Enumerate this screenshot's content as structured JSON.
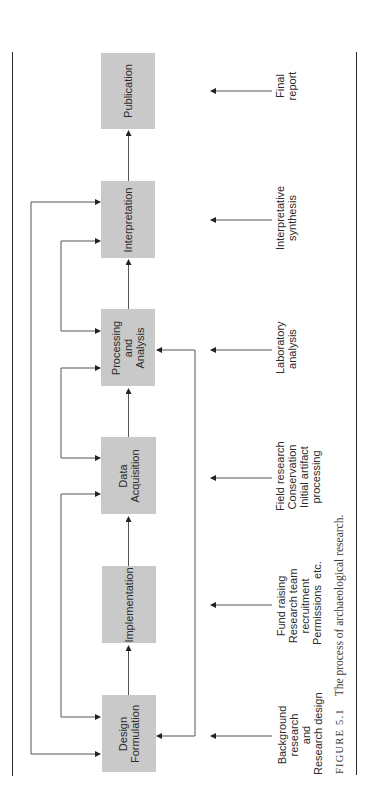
{
  "diagram": {
    "orientation": "rotated 90° counter-clockwise (flow runs bottom to top)",
    "stages": [
      {
        "id": "design",
        "label": "Design\nFormulation",
        "annotation": "Background\nresearch\nand\nResearch design"
      },
      {
        "id": "implementation",
        "label": "Implementation",
        "annotation": "Fund raising\nResearch team\nrecruitment\nPermissions  etc."
      },
      {
        "id": "data",
        "label": "Data\nAcquisition",
        "annotation": "Field research\nConservation\nInitial artifact\nprocessing"
      },
      {
        "id": "processing",
        "label": "Processing\nand\nAnalysis",
        "annotation": "Laboratory\nanalysis"
      },
      {
        "id": "interpretation",
        "label": "Interpretation",
        "annotation": "Interpretative\nsynthesis"
      },
      {
        "id": "publication",
        "label": "Publication",
        "annotation": "Final\nreport"
      }
    ],
    "flow": [
      [
        "Design Formulation",
        "Implementation"
      ],
      [
        "Implementation",
        "Data Acquisition"
      ],
      [
        "Data Acquisition",
        "Processing and Analysis"
      ],
      [
        "Processing and Analysis",
        "Interpretation"
      ],
      [
        "Interpretation",
        "Publication"
      ]
    ],
    "feedback_loops": [
      [
        "Design Formulation",
        "Interpretation"
      ],
      [
        "Design Formulation",
        "Data Acquisition"
      ],
      [
        "Data Acquisition",
        "Processing and Analysis"
      ],
      [
        "Processing and Analysis",
        "Interpretation"
      ],
      [
        "Processing and Analysis",
        "Design Formulation"
      ]
    ],
    "colors": {
      "box_fill": "#c9c9c9",
      "line": "#333333",
      "text": "#2b2b2b"
    }
  },
  "caption": {
    "figure_label": "FIGURE 5.1",
    "text": "The process of archaeological research."
  }
}
